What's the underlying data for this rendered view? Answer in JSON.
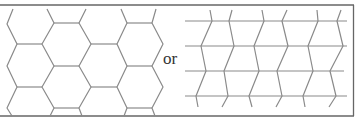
{
  "figure": {
    "connector_text": "or",
    "left_panel": {
      "pattern": "hexagonal lattice (honeycomb)"
    },
    "right_panel": {
      "pattern": "brick-wall lattice with zigzag vertical bonds, 4 horizontal lines"
    }
  },
  "colors": {
    "background": "#ffffff",
    "line": "#8a8a8a",
    "border": "#666666",
    "text": "#333333"
  }
}
